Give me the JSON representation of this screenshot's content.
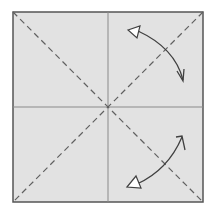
{
  "diagram": {
    "paper": {
      "fill": "#e2e2e2",
      "stroke": "#555555",
      "x": 13,
      "y": 12,
      "size": 190
    },
    "folds": [
      {
        "type": "crease",
        "style": "solid",
        "from": [
          108,
          12
        ],
        "to": [
          108,
          202
        ]
      },
      {
        "type": "crease",
        "style": "solid",
        "from": [
          13,
          107
        ],
        "to": [
          203,
          107
        ]
      },
      {
        "type": "valley",
        "style": "dashed",
        "from": [
          13,
          12
        ],
        "to": [
          203,
          202
        ]
      },
      {
        "type": "valley",
        "style": "dashed",
        "from": [
          203,
          12
        ],
        "to": [
          13,
          202
        ]
      }
    ],
    "arrows": [
      {
        "name": "fold-and-unfold-arrow-top-right",
        "from": [
          186,
          80
        ],
        "to": [
          134,
          32
        ]
      },
      {
        "name": "fold-and-unfold-arrow-bottom-right",
        "from": [
          183,
          138
        ],
        "to": [
          130,
          185
        ]
      }
    ],
    "colors": {
      "line": "#606060",
      "crease": "#8a8a8a",
      "arrow": "#404040",
      "arrowhead_fill": "#ffffff"
    }
  }
}
